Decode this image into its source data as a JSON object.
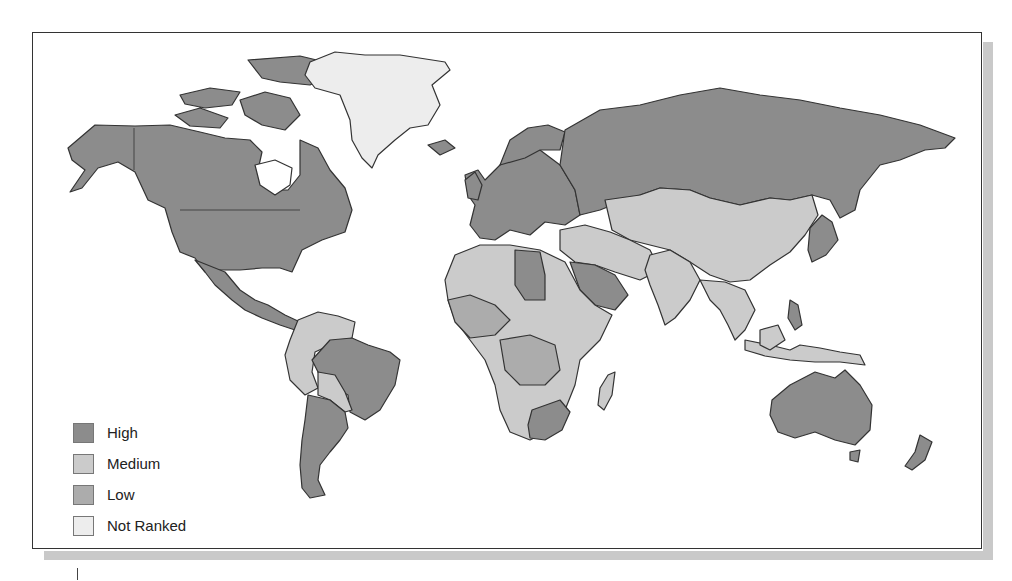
{
  "map": {
    "type": "choropleth-world",
    "colors": {
      "high": "#8c8c8c",
      "medium": "#cbcbcb",
      "low": "#acacac",
      "not_ranked": "#ededed",
      "border": "#333333",
      "water": "#ffffff"
    },
    "legend": {
      "items": [
        {
          "label": "High",
          "color": "#8c8c8c"
        },
        {
          "label": "Medium",
          "color": "#cbcbcb"
        },
        {
          "label": "Low",
          "color": "#acacac"
        },
        {
          "label": "Not Ranked",
          "color": "#ededed"
        }
      ]
    },
    "regions": [
      {
        "name": "North America (US, Canada, Alaska)",
        "category": "High"
      },
      {
        "name": "Greenland",
        "category": "Not Ranked"
      },
      {
        "name": "Mexico / Central America",
        "category": "High"
      },
      {
        "name": "Brazil",
        "category": "High"
      },
      {
        "name": "Argentina / Chile",
        "category": "High"
      },
      {
        "name": "Andean / Northern South America",
        "category": "Medium"
      },
      {
        "name": "Europe",
        "category": "High"
      },
      {
        "name": "Russia",
        "category": "High"
      },
      {
        "name": "Central Asia / China / Mongolia",
        "category": "Medium"
      },
      {
        "name": "Middle East (Saudi Arabia)",
        "category": "High"
      },
      {
        "name": "Africa (most)",
        "category": "Medium"
      },
      {
        "name": "North/West Africa (various)",
        "category": "Low"
      },
      {
        "name": "South Africa",
        "category": "High"
      },
      {
        "name": "India / South Asia",
        "category": "Medium"
      },
      {
        "name": "Southeast Asia",
        "category": "Medium"
      },
      {
        "name": "Japan / Korea",
        "category": "High"
      },
      {
        "name": "Australia",
        "category": "High"
      },
      {
        "name": "New Zealand",
        "category": "High"
      }
    ]
  }
}
